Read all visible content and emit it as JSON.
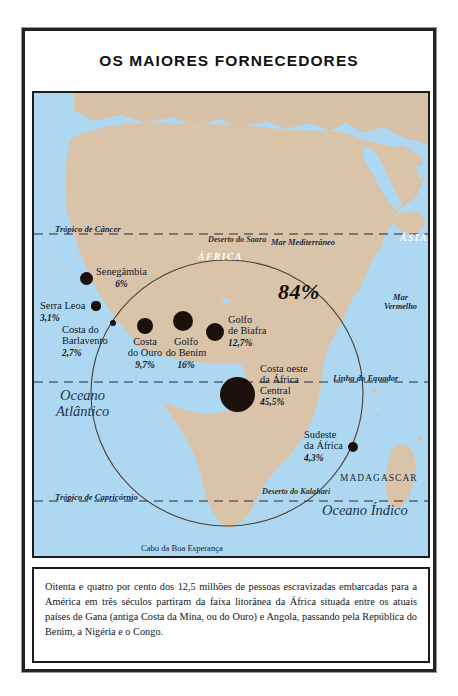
{
  "title": "OS MAIORES FORNECEDORES",
  "caption": "Oitenta e quatro por cento dos 12,5 milhões de pessoas escravizadas embarcadas para a América em três séculos partiram da faixa litorânea da África situada entre os atuais países de Gana (antiga Costa da Mina, ou do Ouro) e Angola, passando pela República do Benim, a Nigéria e o Congo.",
  "map": {
    "highlight_percent": "84%",
    "continents": [
      {
        "label": "ÁFRICA",
        "x": 164,
        "y": 159
      },
      {
        "label": "ÁSIA",
        "x": 366,
        "y": 140
      }
    ],
    "oceans": [
      {
        "label": "Oceano",
        "label2": "Atlântico",
        "x": 52,
        "y": 394
      },
      {
        "label": "Oceano Índico",
        "label2": "",
        "x": 333,
        "y": 516
      }
    ],
    "seas": [
      {
        "label": "Mar Mediterrâneo",
        "label2": "",
        "x": 237,
        "y": 145
      },
      {
        "label": "Mar",
        "label2": "Vermelho",
        "x": 350,
        "y": 207
      }
    ],
    "deserts": [
      {
        "label": "Deserto do Saara",
        "x": 185,
        "y": 209
      },
      {
        "label": "Deserto do Kalahari",
        "x": 241,
        "y": 461
      }
    ],
    "latitudes": [
      {
        "label": "Trópico de Câncer",
        "x": 31,
        "y": 201
      },
      {
        "label": "Linha do Equador",
        "x": 351,
        "y": 350
      },
      {
        "label": "Trópico de Capricórnio",
        "x": 31,
        "y": 468
      }
    ],
    "countries": [
      {
        "label": "MADAGASCAR",
        "x": 358,
        "y": 447
      }
    ],
    "capes": [
      {
        "label": "Cabo da Boa Esperança",
        "x": 120,
        "y": 517
      }
    ],
    "regions": [
      {
        "name": "Senegâmbia",
        "name2": "",
        "percent": "6%",
        "dot": {
          "cx": 73,
          "cy": 252,
          "r": 6.5
        },
        "label": {
          "x": 84,
          "y": 244,
          "align": "left"
        }
      },
      {
        "name": "Serra Leoa",
        "name2": "",
        "percent": "3,1%",
        "dot": {
          "cx": 84,
          "cy": 281,
          "r": 4.6
        },
        "label": {
          "x": 28,
          "y": 282,
          "align": "left"
        }
      },
      {
        "name": "Costa do",
        "name2": "Barlavento",
        "percent": "2,7%",
        "dot": {
          "cx": 101,
          "cy": 298,
          "r": 3.2
        },
        "label": {
          "x": 50,
          "y": 298,
          "align": "left"
        }
      },
      {
        "name": "Costa",
        "name2": "do Ouro",
        "percent": "9,7%",
        "dot": {
          "cx": 138,
          "cy": 300,
          "r": 8.2
        },
        "label": {
          "x": 113,
          "y": 310,
          "align": "center"
        }
      },
      {
        "name": "Golfo",
        "name2": "do Benim",
        "percent": "16%",
        "dot": {
          "cx": 176,
          "cy": 295,
          "r": 10.2
        },
        "label": {
          "x": 151,
          "y": 310,
          "align": "center"
        }
      },
      {
        "name": "Golfo",
        "name2": "de Biafra",
        "percent": "12,7%",
        "dot": {
          "cx": 208,
          "cy": 306,
          "r": 9.0
        },
        "label": {
          "x": 222,
          "y": 291,
          "align": "left"
        }
      },
      {
        "name": "Costa oeste",
        "name2": "da África",
        "name3": "Central",
        "percent": "45,5%",
        "dot": {
          "cx": 229,
          "cy": 367,
          "r": 17.5
        },
        "label": {
          "x": 254,
          "y": 340,
          "align": "left"
        }
      },
      {
        "name": "Sudeste",
        "name2": "da África",
        "percent": "4,3%",
        "dot": {
          "cx": 350,
          "cy": 430,
          "r": 5.2
        },
        "label": {
          "x": 298,
          "y": 414,
          "align": "left"
        }
      }
    ]
  },
  "colors": {
    "ocean": "#aed8f2",
    "land": "#d9c3a9",
    "dot": "#1c100c",
    "frame": "#1b1b1b",
    "text": "#101a28"
  }
}
